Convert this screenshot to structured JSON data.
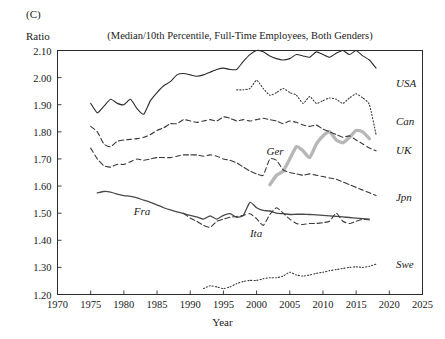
{
  "panel": {
    "letter": "(C)"
  },
  "axes": {
    "y_axis_name": "Ratio",
    "x_axis_title": "Year",
    "y_ticks": [
      "1.20",
      "1.30",
      "1.40",
      "1.50",
      "1.60",
      "1.70",
      "1.80",
      "1.90",
      "2.00",
      "2.10"
    ],
    "x_ticks": [
      "1970",
      "1975",
      "1980",
      "1985",
      "1990",
      "1995",
      "2000",
      "2005",
      "2010",
      "2015",
      "2020",
      "2025"
    ]
  },
  "chart_data": {
    "type": "line",
    "title": "(Median/10th Percentile, Full-Time Employees, Both Genders)",
    "xlabel": "Year",
    "ylabel": "Ratio",
    "xlim": [
      1970,
      2025
    ],
    "ylim": [
      1.2,
      2.1
    ],
    "grid": false,
    "legend": "inline-labels",
    "series": [
      {
        "name": "USA",
        "label": "USA",
        "style": "solid",
        "color": "#2b2b2b",
        "width": 1.1,
        "label_x": 2021.0,
        "label_y": 1.975,
        "x": [
          1975,
          1976,
          1977,
          1978,
          1979,
          1980,
          1981,
          1982,
          1983,
          1984,
          1985,
          1986,
          1987,
          1988,
          1989,
          1990,
          1991,
          1992,
          1993,
          1994,
          1995,
          1996,
          1997,
          1998,
          1999,
          2000,
          2001,
          2002,
          2003,
          2004,
          2005,
          2006,
          2007,
          2008,
          2009,
          2010,
          2011,
          2012,
          2013,
          2014,
          2015,
          2016,
          2017,
          2018
        ],
        "y": [
          1.905,
          1.87,
          1.895,
          1.92,
          1.905,
          1.9,
          1.92,
          1.885,
          1.865,
          1.915,
          1.945,
          1.97,
          1.985,
          2.01,
          2.015,
          2.01,
          2.005,
          2.01,
          2.02,
          2.03,
          2.035,
          2.03,
          2.03,
          2.06,
          2.085,
          2.1,
          2.095,
          2.08,
          2.07,
          2.065,
          2.07,
          2.085,
          2.08,
          2.075,
          2.095,
          2.085,
          2.075,
          2.09,
          2.1,
          2.085,
          2.1,
          2.08,
          2.065,
          2.035
        ]
      },
      {
        "name": "Can",
        "label": "Can",
        "style": "dotted",
        "color": "#3a3a3a",
        "width": 1.1,
        "label_x": 2021.0,
        "label_y": 1.835,
        "x": [
          1997,
          1998,
          1999,
          2000,
          2001,
          2002,
          2003,
          2004,
          2005,
          2006,
          2007,
          2008,
          2009,
          2010,
          2011,
          2012,
          2013,
          2014,
          2015,
          2016,
          2017,
          2018
        ],
        "y": [
          1.955,
          1.955,
          1.96,
          1.99,
          1.96,
          1.935,
          1.945,
          1.96,
          1.945,
          1.935,
          1.905,
          1.93,
          1.905,
          1.915,
          1.925,
          1.92,
          1.905,
          1.925,
          1.94,
          1.925,
          1.9,
          1.79
        ]
      },
      {
        "name": "Ger",
        "label": "Ger",
        "style": "solid-thick",
        "color": "#b7b7b7",
        "width": 3.4,
        "label_x": 2001.5,
        "label_y": 1.725,
        "x": [
          2002,
          2003,
          2004,
          2005,
          2006,
          2007,
          2008,
          2009,
          2010,
          2011,
          2012,
          2013,
          2014,
          2015,
          2016,
          2017
        ],
        "y": [
          1.605,
          1.64,
          1.655,
          1.7,
          1.745,
          1.73,
          1.705,
          1.755,
          1.785,
          1.8,
          1.77,
          1.76,
          1.78,
          1.805,
          1.8,
          1.775
        ]
      },
      {
        "name": "UK",
        "label": "UK",
        "style": "dashed",
        "color": "#3a3a3a",
        "width": 1.1,
        "label_x": 2021.0,
        "label_y": 1.73,
        "x": [
          1975,
          1976,
          1977,
          1978,
          1979,
          1980,
          1981,
          1982,
          1983,
          1984,
          1985,
          1986,
          1987,
          1988,
          1989,
          1990,
          1991,
          1992,
          1993,
          1994,
          1995,
          1996,
          1997,
          1998,
          1999,
          2000,
          2001,
          2002,
          2003,
          2004,
          2005,
          2006,
          2007,
          2008,
          2009,
          2010,
          2011,
          2012,
          2013,
          2014,
          2015,
          2016,
          2017,
          2018
        ],
        "y": [
          1.82,
          1.8,
          1.755,
          1.745,
          1.765,
          1.77,
          1.772,
          1.775,
          1.78,
          1.79,
          1.805,
          1.815,
          1.83,
          1.83,
          1.845,
          1.84,
          1.835,
          1.84,
          1.845,
          1.84,
          1.855,
          1.85,
          1.84,
          1.845,
          1.84,
          1.845,
          1.85,
          1.845,
          1.84,
          1.83,
          1.84,
          1.835,
          1.825,
          1.82,
          1.825,
          1.81,
          1.8,
          1.79,
          1.78,
          1.785,
          1.77,
          1.755,
          1.74,
          1.73
        ]
      },
      {
        "name": "Jpn",
        "label": "Jpn",
        "style": "dashed",
        "color": "#3a3a3a",
        "width": 1.1,
        "label_x": 2021.0,
        "label_y": 1.555,
        "x": [
          1975,
          1976,
          1977,
          1978,
          1979,
          1980,
          1981,
          1982,
          1983,
          1984,
          1985,
          1986,
          1987,
          1988,
          1989,
          1990,
          1991,
          1992,
          1993,
          1994,
          1995,
          1996,
          1997,
          1998,
          1999,
          2000,
          2001,
          2002,
          2003,
          2004,
          2005,
          2006,
          2007,
          2008,
          2009,
          2010,
          2011,
          2012,
          2013,
          2014,
          2015,
          2016,
          2017,
          2018
        ],
        "y": [
          1.74,
          1.7,
          1.675,
          1.67,
          1.68,
          1.68,
          1.69,
          1.7,
          1.695,
          1.7,
          1.705,
          1.705,
          1.705,
          1.71,
          1.715,
          1.715,
          1.715,
          1.71,
          1.715,
          1.71,
          1.7,
          1.695,
          1.685,
          1.67,
          1.655,
          1.645,
          1.64,
          1.7,
          1.695,
          1.66,
          1.65,
          1.645,
          1.64,
          1.645,
          1.64,
          1.635,
          1.63,
          1.625,
          1.615,
          1.605,
          1.595,
          1.585,
          1.575,
          1.565
        ]
      },
      {
        "name": "Fra",
        "label": "Fra",
        "style": "solid",
        "color": "#4a4a4a",
        "width": 1.3,
        "label_x": 1981.5,
        "label_y": 1.505,
        "x": [
          1976,
          1977,
          1978,
          1979,
          1980,
          1981,
          1982,
          1983,
          1984,
          1985,
          1986,
          1987,
          1988,
          1989,
          1990,
          1991,
          1992,
          1993,
          1994,
          1995,
          1996,
          1997,
          1998,
          1999,
          2000,
          2001,
          2002,
          2003,
          2004,
          2005,
          2006,
          2007,
          2008,
          2009,
          2010,
          2011,
          2012,
          2013,
          2014,
          2015,
          2016,
          2017
        ],
        "y": [
          1.575,
          1.58,
          1.578,
          1.57,
          1.565,
          1.562,
          1.556,
          1.548,
          1.54,
          1.53,
          1.52,
          1.512,
          1.505,
          1.498,
          1.492,
          1.486,
          1.478,
          1.49,
          1.478,
          1.492,
          1.498,
          1.485,
          1.492,
          1.54,
          1.52,
          1.51,
          1.508,
          1.5,
          1.498,
          1.495,
          1.496,
          1.496,
          1.495,
          1.494,
          1.492,
          1.49,
          1.488,
          1.486,
          1.484,
          1.482,
          1.48,
          1.478
        ]
      },
      {
        "name": "Ita",
        "label": "Ita",
        "style": "dashed",
        "color": "#3a3a3a",
        "width": 1.1,
        "label_x": 1999.0,
        "label_y": 1.425,
        "x": [
          1989,
          1990,
          1991,
          1992,
          1993,
          1994,
          1995,
          1996,
          1997,
          1998,
          1999,
          2000,
          2001,
          2002,
          2003,
          2004,
          2005,
          2006,
          2007,
          2008,
          2009,
          2010,
          2011,
          2012,
          2013,
          2014,
          2015,
          2016,
          2017
        ],
        "y": [
          1.5,
          1.482,
          1.47,
          1.455,
          1.448,
          1.47,
          1.478,
          1.485,
          1.488,
          1.492,
          1.498,
          1.48,
          1.455,
          1.495,
          1.52,
          1.5,
          1.478,
          1.462,
          1.458,
          1.462,
          1.462,
          1.465,
          1.47,
          1.5,
          1.47,
          1.462,
          1.47,
          1.478,
          1.475
        ]
      },
      {
        "name": "Swe",
        "label": "Swe",
        "style": "dotted",
        "color": "#3a3a3a",
        "width": 1.1,
        "label_x": 2021.0,
        "label_y": 1.31,
        "x": [
          1992,
          1993,
          1994,
          1995,
          1996,
          1997,
          1998,
          1999,
          2000,
          2001,
          2002,
          2003,
          2004,
          2005,
          2006,
          2007,
          2008,
          2009,
          2010,
          2011,
          2012,
          2013,
          2014,
          2015,
          2016,
          2017,
          2018
        ],
        "y": [
          1.222,
          1.232,
          1.228,
          1.222,
          1.228,
          1.24,
          1.248,
          1.252,
          1.252,
          1.258,
          1.262,
          1.262,
          1.268,
          1.282,
          1.272,
          1.268,
          1.272,
          1.278,
          1.282,
          1.288,
          1.292,
          1.296,
          1.3,
          1.302,
          1.3,
          1.304,
          1.312
        ]
      }
    ]
  }
}
